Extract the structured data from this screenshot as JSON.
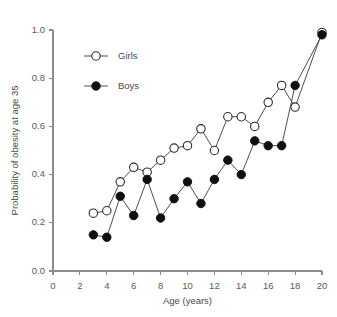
{
  "chart_data": {
    "type": "line",
    "title": "",
    "xlabel": "Age (years)",
    "ylabel": "Probability of obesity at age 35",
    "xlim": [
      0,
      20
    ],
    "ylim": [
      0.0,
      1.0
    ],
    "xticks": [
      0,
      2,
      4,
      6,
      8,
      10,
      12,
      14,
      16,
      18,
      20
    ],
    "xtick_labels": [
      "0",
      "2",
      "4",
      "6",
      "8",
      "10",
      "12",
      "14",
      "16",
      "18",
      "20"
    ],
    "yticks": [
      0.0,
      0.2,
      0.4,
      0.6,
      0.8,
      1.0
    ],
    "ytick_labels": [
      "0.0",
      "0.2",
      "0.4",
      "0.6",
      "0.8",
      "1.0"
    ],
    "grid": false,
    "legend_position": "upper left",
    "series": [
      {
        "name": "Girls",
        "marker": "open-circle",
        "color": "#2b2b2b",
        "x": [
          3,
          4,
          5,
          6,
          7,
          8,
          9,
          10,
          11,
          12,
          13,
          14,
          15,
          16,
          17,
          18,
          20
        ],
        "values": [
          0.24,
          0.25,
          0.37,
          0.43,
          0.41,
          0.46,
          0.51,
          0.52,
          0.59,
          0.5,
          0.64,
          0.64,
          0.6,
          0.7,
          0.77,
          0.68,
          0.99
        ]
      },
      {
        "name": "Boys",
        "marker": "filled-circle",
        "color": "#101010",
        "x": [
          3,
          4,
          5,
          6,
          7,
          8,
          9,
          10,
          11,
          12,
          13,
          14,
          15,
          16,
          17,
          18,
          20
        ],
        "values": [
          0.15,
          0.14,
          0.31,
          0.23,
          0.38,
          0.22,
          0.3,
          0.37,
          0.28,
          0.38,
          0.46,
          0.4,
          0.54,
          0.52,
          0.52,
          0.77,
          0.98
        ]
      }
    ]
  },
  "legend": {
    "girls_label": "Girls",
    "boys_label": "Boys"
  },
  "caption": {
    "cutoff_text": ""
  }
}
